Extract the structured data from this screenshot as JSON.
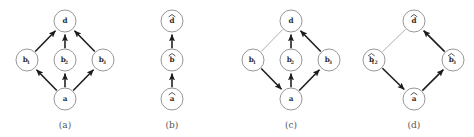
{
  "figure": {
    "panels": [
      {
        "id": "a",
        "caption": "(a)",
        "caption_x": 65,
        "caption_y": 128,
        "nodes": [
          {
            "name": "node-d",
            "label": "d",
            "sub": "",
            "hat": false,
            "cx": 65,
            "cy": 21
          },
          {
            "name": "node-b1",
            "label": "b",
            "sub": "1",
            "hat": false,
            "cx": 27,
            "cy": 60
          },
          {
            "name": "node-b2",
            "label": "b",
            "sub": "2",
            "hat": false,
            "cx": 65,
            "cy": 60
          },
          {
            "name": "node-b3",
            "label": "b",
            "sub": "3",
            "hat": false,
            "cx": 103,
            "cy": 60
          },
          {
            "name": "node-a",
            "label": "a",
            "sub": "",
            "hat": false,
            "cx": 65,
            "cy": 99
          }
        ],
        "edges": [
          {
            "name": "edge-a-to-b1",
            "from": "node-a",
            "to": "node-b1",
            "style": "bold",
            "arrow": true
          },
          {
            "name": "edge-a-to-b2",
            "from": "node-a",
            "to": "node-b2",
            "style": "bold",
            "arrow": true
          },
          {
            "name": "edge-a-to-b3",
            "from": "node-a",
            "to": "node-b3",
            "style": "bold",
            "arrow": true
          },
          {
            "name": "edge-b1-to-d",
            "from": "node-b1",
            "to": "node-d",
            "style": "bold",
            "arrow": true
          },
          {
            "name": "edge-b2-to-d",
            "from": "node-b2",
            "to": "node-d",
            "style": "bold",
            "arrow": true
          },
          {
            "name": "edge-b3-to-d",
            "from": "node-b3",
            "to": "node-d",
            "style": "bold",
            "arrow": true
          }
        ]
      },
      {
        "id": "b",
        "caption": "(b)",
        "caption_x": 172,
        "caption_y": 128,
        "nodes": [
          {
            "name": "node-d-hat",
            "label": "d",
            "sub": "",
            "hat": true,
            "cx": 172,
            "cy": 21
          },
          {
            "name": "node-b-hat",
            "label": "b",
            "sub": "",
            "hat": true,
            "cx": 172,
            "cy": 60
          },
          {
            "name": "node-a-hat",
            "label": "a",
            "sub": "",
            "hat": true,
            "cx": 172,
            "cy": 99
          }
        ],
        "edges": [
          {
            "name": "edge-ahat-to-bhat",
            "from": "node-a-hat",
            "to": "node-b-hat",
            "style": "bold",
            "arrow": true
          },
          {
            "name": "edge-bhat-to-dhat",
            "from": "node-b-hat",
            "to": "node-d-hat",
            "style": "bold",
            "arrow": true
          }
        ]
      },
      {
        "id": "c",
        "caption": "(c)",
        "caption_x": 291,
        "caption_y": 128,
        "nodes": [
          {
            "name": "node-d",
            "label": "d",
            "sub": "",
            "hat": false,
            "cx": 291,
            "cy": 21
          },
          {
            "name": "node-b1",
            "label": "b",
            "sub": "1",
            "hat": false,
            "cx": 253,
            "cy": 60
          },
          {
            "name": "node-b2",
            "label": "b",
            "sub": "2",
            "hat": false,
            "cx": 291,
            "cy": 60
          },
          {
            "name": "node-b3",
            "label": "b",
            "sub": "3",
            "hat": false,
            "cx": 329,
            "cy": 60
          },
          {
            "name": "node-a",
            "label": "a",
            "sub": "",
            "hat": false,
            "cx": 291,
            "cy": 99
          }
        ],
        "edges": [
          {
            "name": "edge-b1-to-d-reversed",
            "from": "node-b1",
            "to": "node-d",
            "style": "thin",
            "arrow": false
          },
          {
            "name": "edge-b1-to-a",
            "from": "node-b1",
            "to": "node-a",
            "style": "bold",
            "arrow": true
          },
          {
            "name": "edge-a-to-b2",
            "from": "node-a",
            "to": "node-b2",
            "style": "bold",
            "arrow": true
          },
          {
            "name": "edge-b2-to-d",
            "from": "node-b2",
            "to": "node-d",
            "style": "bold",
            "arrow": true
          },
          {
            "name": "edge-a-to-b3",
            "from": "node-a",
            "to": "node-b3",
            "style": "bold",
            "arrow": true
          },
          {
            "name": "edge-b3-to-d",
            "from": "node-b3",
            "to": "node-d",
            "style": "bold",
            "arrow": true
          }
        ]
      },
      {
        "id": "d",
        "caption": "(d)",
        "caption_x": 414,
        "caption_y": 128,
        "nodes": [
          {
            "name": "node-d-hat",
            "label": "d",
            "sub": "",
            "hat": true,
            "cx": 414,
            "cy": 21
          },
          {
            "name": "node-b12-hat",
            "label": "b",
            "sub": "12",
            "hat": true,
            "cx": 374,
            "cy": 60
          },
          {
            "name": "node-b3-hat",
            "label": "b",
            "sub": "3",
            "hat": true,
            "cx": 453,
            "cy": 60
          },
          {
            "name": "node-a-hat",
            "label": "a",
            "sub": "",
            "hat": true,
            "cx": 414,
            "cy": 99
          }
        ],
        "edges": [
          {
            "name": "edge-b12hat-to-dhat",
            "from": "node-b12-hat",
            "to": "node-d-hat",
            "style": "thin",
            "arrow": false
          },
          {
            "name": "edge-b12hat-to-ahat",
            "from": "node-b12-hat",
            "to": "node-a-hat",
            "style": "bold",
            "arrow": true
          },
          {
            "name": "edge-ahat-to-b3hat",
            "from": "node-a-hat",
            "to": "node-b3-hat",
            "style": "bold",
            "arrow": true
          },
          {
            "name": "edge-b3hat-to-dhat",
            "from": "node-b3-hat",
            "to": "node-d-hat",
            "style": "bold",
            "arrow": true
          }
        ]
      }
    ],
    "node_radius": 11,
    "colors": {
      "node_stroke": "#8c8c8c",
      "node_fill": "#ffffff",
      "edge_bold": "#1c1c1c",
      "edge_thin": "#9a9a9a",
      "label_text": "#2b2b2b",
      "caption_text": "#555555",
      "background": "#ffffff"
    }
  }
}
